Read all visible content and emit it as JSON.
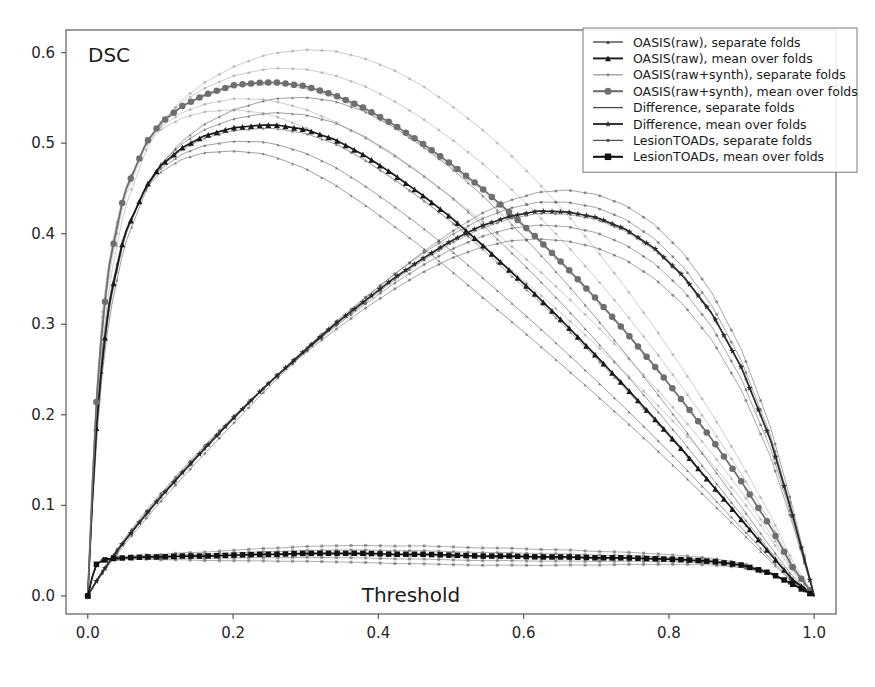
{
  "figure": {
    "corner_label": "DSC",
    "xlabel": "Threshold",
    "background": "#ffffff"
  },
  "axes": {
    "x_ticks": [
      "0.0",
      "0.2",
      "0.4",
      "0.6",
      "0.8",
      "1.0"
    ],
    "x_tick_values": [
      0.0,
      0.2,
      0.4,
      0.6,
      0.8,
      1.0
    ],
    "y_ticks": [
      "0.0",
      "0.1",
      "0.2",
      "0.3",
      "0.4",
      "0.5",
      "0.6"
    ],
    "y_tick_values": [
      0.0,
      0.1,
      0.2,
      0.3,
      0.4,
      0.5,
      0.6
    ],
    "xlim": [
      -0.03,
      1.03
    ],
    "ylim": [
      -0.02,
      0.625
    ],
    "grid": false
  },
  "legend": {
    "position": "upper right",
    "entries": [
      {
        "label": "OASIS(raw), separate folds",
        "marker": "triangle-small",
        "color": "#3a3a3a",
        "linewidth": 1.0,
        "markersize": 3.5
      },
      {
        "label": "OASIS(raw), mean over folds",
        "marker": "triangle-large",
        "color": "#1a1a1a",
        "linewidth": 1.6,
        "markersize": 6.0
      },
      {
        "label": "OASIS(raw+synth), separate folds",
        "marker": "circle-small",
        "color": "#9a9a9a",
        "linewidth": 1.0,
        "markersize": 3.5
      },
      {
        "label": "OASIS(raw+synth), mean over folds",
        "marker": "circle-large",
        "color": "#6e6e6e",
        "linewidth": 1.8,
        "markersize": 7.0
      },
      {
        "label": "Difference, separate folds",
        "marker": "line",
        "color": "#4a4a4a",
        "linewidth": 1.0,
        "markersize": 2.5
      },
      {
        "label": "Difference, mean over folds",
        "marker": "star",
        "color": "#2a2a2a",
        "linewidth": 1.6,
        "markersize": 6.0
      },
      {
        "label": "LesionTOADs, separate folds",
        "marker": "square-small",
        "color": "#555555",
        "linewidth": 1.0,
        "markersize": 3.0
      },
      {
        "label": "LesionTOADs, mean over folds",
        "marker": "square-large",
        "color": "#111111",
        "linewidth": 1.8,
        "markersize": 6.5
      }
    ]
  },
  "chart_data": {
    "type": "line",
    "title": "",
    "xlabel": "Threshold",
    "ylabel": "DSC",
    "xlim": [
      -0.03,
      1.03
    ],
    "ylim": [
      -0.02,
      0.625
    ],
    "grid": false,
    "legend_position": "upper right",
    "x": [
      0.0,
      0.01,
      0.02,
      0.03,
      0.05,
      0.08,
      0.1,
      0.13,
      0.16,
      0.2,
      0.24,
      0.26,
      0.3,
      0.34,
      0.38,
      0.42,
      0.46,
      0.5,
      0.54,
      0.58,
      0.62,
      0.66,
      0.7,
      0.74,
      0.78,
      0.82,
      0.86,
      0.9,
      0.94,
      0.97,
      1.0
    ],
    "series": [
      {
        "name": "OASIS(raw), mean over folds",
        "role": "mean",
        "color": "#1a1a1a",
        "marker": "triangle",
        "values": [
          0.0,
          0.168,
          0.262,
          0.325,
          0.398,
          0.452,
          0.475,
          0.495,
          0.508,
          0.517,
          0.52,
          0.52,
          0.515,
          0.504,
          0.487,
          0.466,
          0.443,
          0.418,
          0.39,
          0.36,
          0.33,
          0.298,
          0.265,
          0.231,
          0.196,
          0.16,
          0.122,
          0.084,
          0.046,
          0.018,
          0.0
        ]
      },
      {
        "name": "OASIS(raw+synth), mean over folds",
        "role": "mean",
        "color": "#6e6e6e",
        "marker": "circle",
        "values": [
          0.0,
          0.195,
          0.3,
          0.368,
          0.444,
          0.5,
          0.522,
          0.541,
          0.553,
          0.564,
          0.567,
          0.567,
          0.563,
          0.553,
          0.539,
          0.521,
          0.5,
          0.477,
          0.452,
          0.424,
          0.394,
          0.362,
          0.328,
          0.292,
          0.254,
          0.214,
          0.172,
          0.126,
          0.076,
          0.032,
          0.0
        ]
      },
      {
        "name": "Difference, mean over folds",
        "role": "mean",
        "color": "#2a2a2a",
        "marker": "star",
        "values": [
          0.0,
          0.014,
          0.026,
          0.038,
          0.06,
          0.09,
          0.109,
          0.136,
          0.162,
          0.196,
          0.228,
          0.243,
          0.272,
          0.3,
          0.325,
          0.35,
          0.372,
          0.392,
          0.408,
          0.419,
          0.425,
          0.424,
          0.418,
          0.405,
          0.384,
          0.353,
          0.311,
          0.252,
          0.172,
          0.09,
          0.0
        ]
      },
      {
        "name": "LesionTOADs, mean over folds",
        "role": "mean",
        "color": "#111111",
        "marker": "square",
        "values": [
          0.0,
          0.034,
          0.039,
          0.041,
          0.042,
          0.043,
          0.043,
          0.044,
          0.044,
          0.045,
          0.046,
          0.046,
          0.047,
          0.047,
          0.047,
          0.046,
          0.046,
          0.045,
          0.044,
          0.044,
          0.043,
          0.043,
          0.042,
          0.042,
          0.041,
          0.04,
          0.038,
          0.034,
          0.025,
          0.013,
          0.0
        ]
      },
      {
        "name": "OASIS(raw), separate folds",
        "role": "folds",
        "color": "#3a3a3a",
        "marker": "triangle",
        "offsets": [
          0.03,
          0.014,
          -0.004,
          -0.02,
          -0.034
        ],
        "peak_shifts": [
          0.03,
          0.01,
          0.0,
          -0.02,
          -0.03
        ]
      },
      {
        "name": "OASIS(raw+synth), separate folds",
        "role": "folds",
        "color": "#9a9a9a",
        "marker": "circle",
        "offsets": [
          0.034,
          0.016,
          -0.002,
          -0.02,
          -0.036
        ],
        "peak_shifts": [
          0.04,
          0.015,
          0.0,
          -0.02,
          -0.035
        ]
      },
      {
        "name": "Difference, separate folds",
        "role": "folds",
        "color": "#4a4a4a",
        "marker": "dot",
        "offsets": [
          0.02,
          0.009,
          -0.002,
          -0.012,
          -0.024
        ],
        "peak_shifts": [
          0.03,
          0.01,
          0.0,
          -0.015,
          -0.03
        ]
      },
      {
        "name": "LesionTOADs, separate folds",
        "role": "folds",
        "color": "#555555",
        "marker": "square",
        "offsets": [
          0.007,
          0.003,
          -0.001,
          -0.004,
          -0.008
        ],
        "peak_shifts": [
          0.0,
          0.0,
          0.0,
          0.0,
          0.0
        ]
      }
    ]
  }
}
